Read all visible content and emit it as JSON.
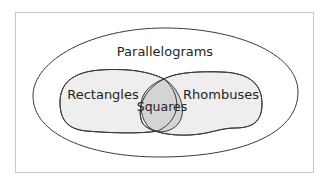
{
  "diagram": {
    "type": "venn",
    "title": "",
    "colors": {
      "background": "#ffffff",
      "frame_border": "#c8c8c8",
      "outline": "#3a3a3a",
      "set_fill": "#eeeeee",
      "intersection_fill": "#d4d4d4",
      "text": "#231f20"
    },
    "sets": {
      "outer": {
        "label": "Parallelograms"
      },
      "left": {
        "label": "Rectangles"
      },
      "right": {
        "label": "Rhombuses"
      },
      "intersection": {
        "label": "Squares"
      }
    },
    "relationships": [
      {
        "subset": "Rectangles",
        "superset": "Parallelograms"
      },
      {
        "subset": "Rhombuses",
        "superset": "Parallelograms"
      },
      {
        "subset": "Squares",
        "superset": "Rectangles"
      },
      {
        "subset": "Squares",
        "superset": "Rhombuses"
      }
    ]
  }
}
